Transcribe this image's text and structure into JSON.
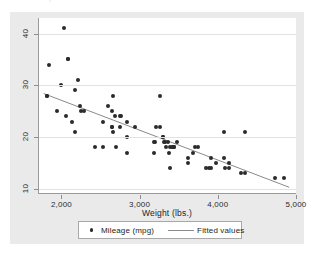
{
  "page": {
    "top_ghost_text": "nmr qmr  tmr                      ntr   nor"
  },
  "legend": {
    "scatter_label": "Mileage (mpg)",
    "fit_label": "Fitted values",
    "marker_icon": "filled-circle-icon",
    "line_icon": "line-segment-icon"
  },
  "colors": {
    "graph_background": "#eaeaea",
    "plot_background": "#ffffff",
    "marker": "#2b2b2b",
    "fit_line": "#8a8a8a",
    "gridline": "#e2e2e6",
    "axis": "#9a9a9a"
  },
  "chart_data": {
    "type": "scatter",
    "title": "",
    "xlabel": "Weight (lbs.)",
    "ylabel": "",
    "xlim": [
      1700,
      5000
    ],
    "ylim": [
      9,
      43
    ],
    "grid": true,
    "legend_position": "bottom",
    "xticks": [
      2000,
      3000,
      4000,
      5000
    ],
    "xtick_labels": [
      "2,000",
      "3,000",
      "4,000",
      "5,000"
    ],
    "yticks": [
      10,
      20,
      30,
      40
    ],
    "ytick_labels": [
      "10",
      "20",
      "30",
      "40"
    ],
    "series": [
      {
        "name": "Mileage (mpg)",
        "type": "scatter",
        "marker": "circle",
        "x": [
          2020,
          1800,
          1800,
          1830,
          1980,
          2070,
          2070,
          2160,
          2200,
          2230,
          2240,
          2280,
          2050,
          1930,
          2120,
          2160,
          2650,
          2520,
          2410,
          2580,
          2670,
          2640,
          2730,
          2750,
          2730,
          2830,
          2930,
          2520,
          2650,
          2640,
          2690,
          2830,
          3170,
          3250,
          3200,
          3180,
          3280,
          3310,
          3300,
          3350,
          3370,
          3420,
          3430,
          3470,
          3380,
          3250,
          3280,
          3330,
          3360,
          3400,
          3600,
          3690,
          3740,
          3670,
          3600,
          3830,
          3880,
          3900,
          4060,
          4080,
          4130,
          4330,
          4290,
          3900,
          3960,
          4060,
          4130,
          4330,
          4720,
          4840,
          2830,
          2640,
          3170,
          3430
        ],
        "y": [
          41,
          28,
          28,
          34,
          30,
          35,
          35,
          29,
          31,
          26,
          25,
          25,
          24,
          25,
          23,
          21,
          28,
          18,
          18,
          26,
          24,
          22,
          24,
          24,
          22,
          20,
          22,
          23,
          21,
          22,
          18,
          17,
          17,
          28,
          22,
          19,
          20,
          19,
          19,
          19,
          18,
          18,
          18,
          19,
          14,
          22,
          20,
          18,
          17,
          18,
          16,
          18,
          18,
          17,
          15,
          14,
          14,
          14,
          21,
          14,
          14,
          21,
          13,
          16,
          15,
          16,
          15,
          13,
          12,
          12,
          23,
          25,
          19,
          18
        ]
      },
      {
        "name": "Fitted values",
        "type": "line",
        "x": [
          1760,
          4900
        ],
        "y": [
          28.4,
          10.3
        ]
      }
    ]
  }
}
